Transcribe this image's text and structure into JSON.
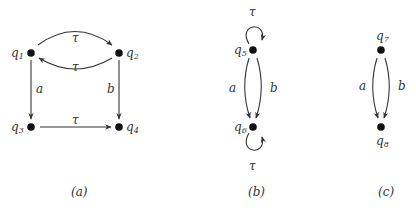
{
  "graphs": [
    {
      "caption": "(a)",
      "nodes": [
        {
          "id": "q1",
          "label": "q",
          "sub": "1"
        },
        {
          "id": "q2",
          "label": "q",
          "sub": "2"
        },
        {
          "id": "q3",
          "label": "q",
          "sub": "3"
        },
        {
          "id": "q4",
          "label": "q",
          "sub": "4"
        }
      ],
      "edges": [
        {
          "from": "q1",
          "to": "q2",
          "label": "τ"
        },
        {
          "from": "q2",
          "to": "q1",
          "label": "τ"
        },
        {
          "from": "q1",
          "to": "q3",
          "label": "a"
        },
        {
          "from": "q2",
          "to": "q4",
          "label": "b"
        },
        {
          "from": "q3",
          "to": "q4",
          "label": "τ"
        }
      ]
    },
    {
      "caption": "(b)",
      "nodes": [
        {
          "id": "q5",
          "label": "q",
          "sub": "5"
        },
        {
          "id": "q6",
          "label": "q",
          "sub": "6"
        }
      ],
      "edges": [
        {
          "from": "q5",
          "to": "q5",
          "label": "τ"
        },
        {
          "from": "q5",
          "to": "q6",
          "label": "a"
        },
        {
          "from": "q5",
          "to": "q6",
          "label": "b"
        },
        {
          "from": "q6",
          "to": "q6",
          "label": "τ"
        }
      ]
    },
    {
      "caption": "(c)",
      "nodes": [
        {
          "id": "q7",
          "label": "q",
          "sub": "7"
        },
        {
          "id": "q8",
          "label": "q",
          "sub": "8"
        }
      ],
      "edges": [
        {
          "from": "q7",
          "to": "q8",
          "label": "a"
        },
        {
          "from": "q7",
          "to": "q8",
          "label": "b"
        }
      ]
    }
  ]
}
